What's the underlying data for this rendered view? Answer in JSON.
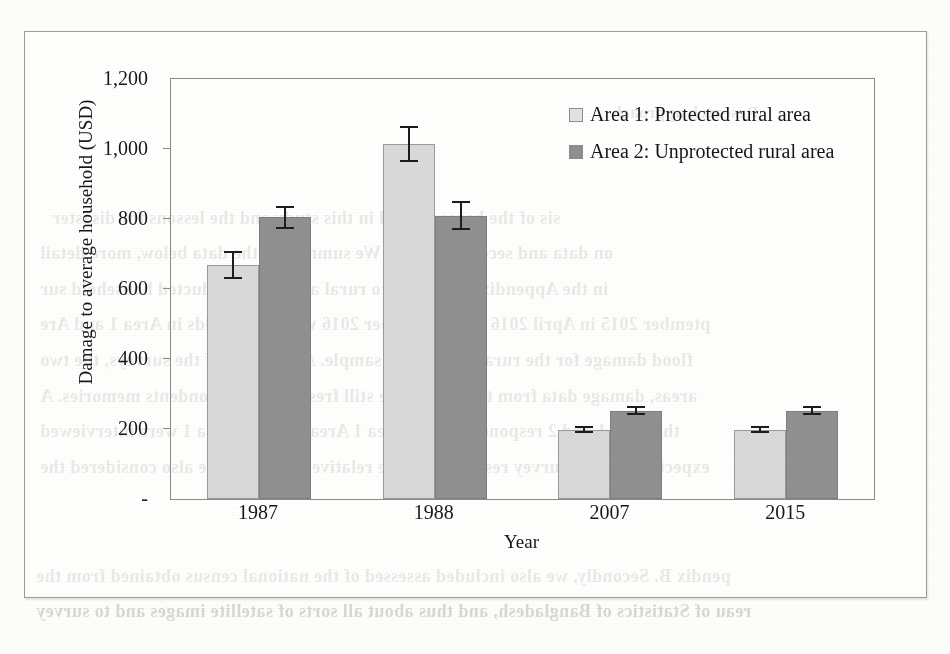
{
  "figure": {
    "y_axis_title": "Damage to average household (USD)",
    "x_axis_title": "Year",
    "zero_tick_label": "-"
  },
  "legend": {
    "series1_label": "Area 1: Protected rural area",
    "series2_label": "Area 2: Unprotected rural area",
    "series1_color": "#d9d9d9",
    "series2_color": "#909090"
  },
  "y_ticks": [
    {
      "label": "1,200",
      "value": 1200
    },
    {
      "label": "1,000",
      "value": 1000
    },
    {
      "label": "800",
      "value": 800
    },
    {
      "label": "600",
      "value": 600
    },
    {
      "label": "400",
      "value": 400
    },
    {
      "label": "200",
      "value": 200
    },
    {
      "label": "-",
      "value": 0
    }
  ],
  "chart_data": {
    "type": "bar",
    "title": "",
    "xlabel": "Year",
    "ylabel": "Damage to average household (USD)",
    "ylim": [
      0,
      1200
    ],
    "ytick_labels": [
      "-",
      "200",
      "400",
      "600",
      "800",
      "1,000",
      "1,200"
    ],
    "grid": false,
    "legend_position": "inside-top-right",
    "error_bars": "symmetric",
    "categories": [
      "1987",
      "1988",
      "2007",
      "2015"
    ],
    "series": [
      {
        "name": "Area 1: Protected rural area",
        "color": "#d9d9d9",
        "values": [
          670,
          1015,
          198,
          198
        ],
        "errors": [
          40,
          52,
          10,
          10
        ]
      },
      {
        "name": "Area 2: Unprotected rural area",
        "color": "#909090",
        "values": [
          805,
          810,
          252,
          252
        ],
        "errors": [
          33,
          42,
          13,
          13
        ]
      }
    ]
  },
  "bleed_through": [
    {
      "text": "Research approach",
      "x": 612,
      "y": 103,
      "size": 17
    },
    {
      "text": "sis of the hazards used in this study and the lessons for disaster",
      "x": 52,
      "y": 208,
      "size": 18
    },
    {
      "text": "on data and secondary data. We summarise the data below, more detail",
      "x": 40,
      "y": 243,
      "size": 18
    },
    {
      "text": "in the Appendix B. In the two rural areas, we conducted household sur",
      "x": 40,
      "y": 279,
      "size": 18
    },
    {
      "text": "ptember 2015 in April 2016 and September 2016 with households in Area 1 and Are",
      "x": 40,
      "y": 314,
      "size": 18
    },
    {
      "text": "flood damage for the rural area-based sample. At the time of the surveys, the two",
      "x": 40,
      "y": 350,
      "size": 18
    },
    {
      "text": "areas, damage data from the flood were still fresh in the respondents memories. A",
      "x": 40,
      "y": 386,
      "size": 18
    },
    {
      "text": "the Area 1 and 2 respondents, the Area 1 Area 2 and in Area 1 were interviewed",
      "x": 40,
      "y": 421,
      "size": 18
    },
    {
      "text": "expected that the survey results would be relatively reliable; we also considered the",
      "x": 40,
      "y": 457,
      "size": 18
    },
    {
      "text": "pendix B. Secondly, we also included assessed of the national census obtained from the",
      "x": 36,
      "y": 566,
      "size": 18
    },
    {
      "text": "reau of Statistics of Bangladesh, and thus about all sorts of satellite images and to survey",
      "x": 36,
      "y": 601,
      "size": 18
    }
  ]
}
